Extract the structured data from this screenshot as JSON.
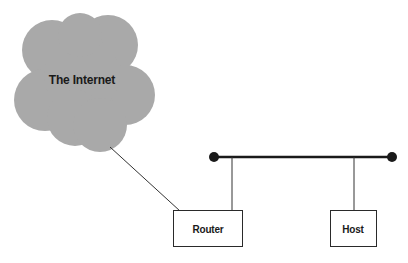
{
  "diagram": {
    "type": "network-topology",
    "colors": {
      "background": "#ffffff",
      "cloud_fill": "#a9a9a9",
      "line": "#2a2a2a",
      "bus": "#1a1a1a",
      "text": "#1a1a1a"
    },
    "nodes": [
      {
        "id": "internet",
        "shape": "cloud",
        "label": "The Internet"
      },
      {
        "id": "router",
        "shape": "box",
        "label": "Router"
      },
      {
        "id": "host",
        "shape": "box",
        "label": "Host"
      }
    ],
    "bus": {
      "id": "lan-segment",
      "endpoints": "filled-circles"
    },
    "edges": [
      {
        "from": "internet",
        "to": "router"
      },
      {
        "from": "router",
        "to": "lan-segment"
      },
      {
        "from": "host",
        "to": "lan-segment"
      }
    ]
  }
}
